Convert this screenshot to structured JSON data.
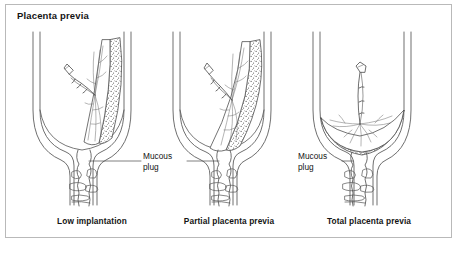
{
  "figure": {
    "title": "Placenta previa",
    "border_color": "#b9b9b9",
    "background_color": "#ffffff",
    "ink_color": "#555555",
    "text_color": "#141414"
  },
  "panels": [
    {
      "id": "low-implantation",
      "caption": "Low implantation",
      "caption_x": 92,
      "caption_y": 216,
      "placenta_extent": "upper right uterine wall, well above the internal os"
    },
    {
      "id": "partial-placenta-previa",
      "caption": "Partial placenta previa",
      "caption_x": 229,
      "caption_y": 216,
      "placenta_extent": "right wall extending down to partially cover the internal os"
    },
    {
      "id": "total-placenta-previa",
      "caption": "Total placenta previa",
      "caption_x": 369,
      "caption_y": 216,
      "placenta_extent": "spans the entire lower uterine segment, completely covering the internal os"
    }
  ],
  "callouts": [
    {
      "id": "mucous-plug-center",
      "line1": "Mucous",
      "line2": "plug",
      "x": 143,
      "y": 156,
      "leader_left": true,
      "leader_right": true
    },
    {
      "id": "mucous-plug-right",
      "line1": "Mucous",
      "line2": "plug",
      "x": 298,
      "y": 156,
      "leader_left": false,
      "leader_right": true
    }
  ]
}
